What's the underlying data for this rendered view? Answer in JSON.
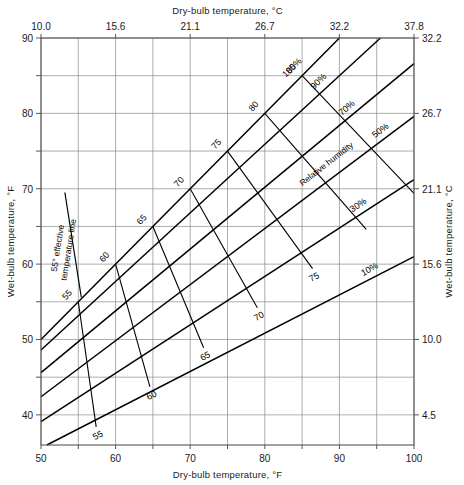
{
  "chart_data": {
    "type": "line",
    "title": "",
    "xlabel": "Dry-bulb temperature, °F",
    "xlabel_top": "Dry-bulb temperature, °C",
    "ylabel": "Wet-bulb temperature, °F",
    "ylabel_right": "Wet-bulb temperature, °C",
    "xlim": [
      50,
      100
    ],
    "ylim": [
      36,
      90
    ],
    "grid": true,
    "legend_position": "inline-labels",
    "x_ticks_f": [
      50,
      55,
      60,
      65,
      70,
      75,
      80,
      85,
      90,
      95,
      100
    ],
    "x_tick_labels_f": [
      "50",
      "",
      "60",
      "",
      "70",
      "",
      "80",
      "",
      "90",
      "",
      "100"
    ],
    "x_ticks_top_f": [
      50,
      60,
      70,
      80,
      90,
      100
    ],
    "x_tick_labels_c": [
      "10.0",
      "15.6",
      "21.1",
      "26.7",
      "32.2",
      "37.8"
    ],
    "y_ticks_f": [
      40,
      45,
      50,
      55,
      60,
      65,
      70,
      75,
      80,
      85,
      90
    ],
    "y_tick_labels_f": [
      "40",
      "",
      "50",
      "",
      "60",
      "",
      "70",
      "",
      "80",
      "",
      "90"
    ],
    "y_ticks_right_f": [
      40,
      50,
      60,
      70,
      80,
      90
    ],
    "y_tick_labels_c": [
      "4.5",
      "10.0",
      "15.6",
      "21.1",
      "26.7",
      "32.2"
    ],
    "rh_label_text": "Relative humidity",
    "rh_lines": [
      {
        "label": "100%",
        "rh": 100,
        "x0": 50,
        "y0": 50,
        "x1": 90,
        "y1": 90
      },
      {
        "label": "90%",
        "rh": 90,
        "x0": 50,
        "y0": 48.6,
        "x1": 95.5,
        "y1": 90
      },
      {
        "label": "70%",
        "rh": 70,
        "x0": 50,
        "y0": 45.6,
        "x1": 100,
        "y1": 86.6
      },
      {
        "label": "50%",
        "rh": 50,
        "x0": 50,
        "y0": 42.4,
        "x1": 100,
        "y1": 79.6
      },
      {
        "label": "30%",
        "rh": 30,
        "x0": 50,
        "y0": 39.1,
        "x1": 100,
        "y1": 71.2
      },
      {
        "label": "10%",
        "rh": 10,
        "x0": 50,
        "y0": 35.6,
        "x1": 100,
        "y1": 61.0
      }
    ],
    "saturation_labels": [
      {
        "text": "55",
        "db": 55,
        "wb": 55
      },
      {
        "text": "60",
        "db": 60,
        "wb": 60
      },
      {
        "text": "65",
        "db": 65,
        "wb": 65
      },
      {
        "text": "70",
        "db": 70,
        "wb": 70
      },
      {
        "text": "75",
        "db": 75,
        "wb": 75
      },
      {
        "text": "80",
        "db": 80,
        "wb": 80
      },
      {
        "text": "85",
        "db": 85,
        "wb": 85
      }
    ],
    "effective_temp_lines": [
      {
        "label": "55",
        "x_top": 55,
        "y_top": 55,
        "x_bot": 57.4,
        "y_bot": 38.4
      },
      {
        "label": "60",
        "x_top": 60,
        "y_top": 60,
        "x_bot": 64.6,
        "y_bot": 43.7
      },
      {
        "label": "65",
        "x_top": 65,
        "y_top": 65,
        "x_bot": 71.8,
        "y_bot": 48.9
      },
      {
        "label": "70",
        "x_top": 70,
        "y_top": 70,
        "x_bot": 79.0,
        "y_bot": 54.2
      },
      {
        "label": "75",
        "x_top": 75,
        "y_top": 75,
        "x_bot": 86.4,
        "y_bot": 59.4
      },
      {
        "label": "80",
        "x_top": 80,
        "y_top": 80,
        "x_bot": 93.6,
        "y_bot": 64.6
      },
      {
        "label": "85",
        "x_top": 85,
        "y_top": 85,
        "x_bot": 100.0,
        "y_bot": 69.4
      }
    ],
    "effective_temp_lower_labels": [
      {
        "text": "55",
        "db": 57.4,
        "wb": 38.4
      },
      {
        "text": "60",
        "db": 64.6,
        "wb": 43.7
      },
      {
        "text": "65",
        "db": 71.8,
        "wb": 48.9
      },
      {
        "text": "70",
        "db": 79.0,
        "wb": 54.2
      },
      {
        "text": "75",
        "db": 86.4,
        "wb": 59.4
      }
    ],
    "annotation": {
      "line1": "55° effective",
      "line2": "temperature line",
      "full_text": "55° effective temperature line"
    }
  }
}
